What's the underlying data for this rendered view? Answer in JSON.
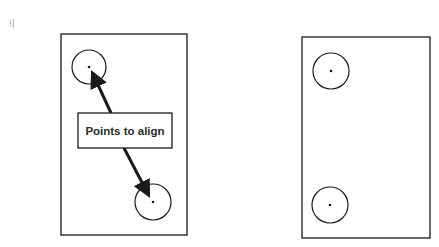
{
  "diagram": {
    "corner_mark": "⁞|",
    "label": "Points to align",
    "colors": {
      "stroke": "#1a1a1a",
      "background": "#ffffff",
      "text": "#2a2a2a"
    },
    "left_panel": {
      "rect": {
        "x": 61,
        "y": 34,
        "w": 126,
        "h": 201
      },
      "circles": [
        {
          "cx": 89,
          "cy": 67,
          "r": 17
        },
        {
          "cx": 153,
          "cy": 202,
          "r": 18
        }
      ],
      "label_box": {
        "x": 78,
        "y": 113,
        "w": 94,
        "h": 35
      }
    },
    "right_panel": {
      "rect": {
        "x": 302,
        "y": 37,
        "w": 128,
        "h": 201
      },
      "circles": [
        {
          "cx": 331,
          "cy": 71,
          "r": 18
        },
        {
          "cx": 330,
          "cy": 205,
          "r": 18
        }
      ]
    }
  }
}
